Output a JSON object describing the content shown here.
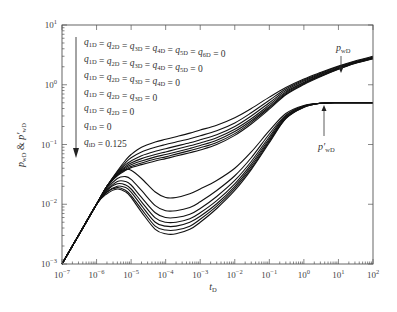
{
  "chart_data": {
    "type": "line",
    "title": "",
    "xlabel": "t_D",
    "ylabel": "p_wD & p'_wD",
    "xscale": "log",
    "yscale": "log",
    "xlim": [
      1e-07,
      100
    ],
    "ylim": [
      0.001,
      10
    ],
    "grid": false,
    "x_ticks": [
      {
        "exp": "-7",
        "value": 1e-07
      },
      {
        "exp": "-6",
        "value": 1e-06
      },
      {
        "exp": "-5",
        "value": 1e-05
      },
      {
        "exp": "-4",
        "value": 0.0001
      },
      {
        "exp": "-3",
        "value": 0.001
      },
      {
        "exp": "-2",
        "value": 0.01
      },
      {
        "exp": "-1",
        "value": 0.1
      },
      {
        "exp": "0",
        "value": 1
      },
      {
        "exp": "1",
        "value": 10
      },
      {
        "exp": "2",
        "value": 100
      }
    ],
    "y_ticks": [
      {
        "exp": "-3",
        "value": 0.001
      },
      {
        "exp": "-2",
        "value": 0.01
      },
      {
        "exp": "-1",
        "value": 0.1
      },
      {
        "exp": "0",
        "value": 1
      },
      {
        "exp": "1",
        "value": 10
      }
    ],
    "legend": {
      "placement": "top-left",
      "arrow": "downward",
      "entries": [
        "q1D = q2D = q3D = q4D = q5D = q6D = 0",
        "q1D = q2D = q3D = q4D = q5D = 0",
        "q1D = q2D = q3D = q4D = 0",
        "q1D = q2D = q3D = 0",
        "q1D = q2D = 0",
        "q1D = 0",
        "qiD = 0.125"
      ]
    },
    "annotations": [
      {
        "text": "p_wD",
        "points_to": {
          "x": 20,
          "y": 2.0
        }
      },
      {
        "text": "p'_wD",
        "points_to": {
          "x": 4,
          "y": 0.48
        }
      }
    ],
    "x": [
      1e-07,
      3e-07,
      1e-06,
      2e-06,
      4e-06,
      7e-06,
      1e-05,
      2e-05,
      5e-05,
      0.0001,
      0.0002,
      0.0005,
      0.001,
      0.003,
      0.01,
      0.03,
      0.1,
      0.3,
      1,
      3,
      10,
      30,
      100
    ],
    "series": [
      {
        "name": "pwD case 1",
        "group": "pressure",
        "values": [
          0.001,
          0.003,
          0.01,
          0.02,
          0.036,
          0.055,
          0.068,
          0.09,
          0.11,
          0.122,
          0.135,
          0.155,
          0.175,
          0.21,
          0.28,
          0.4,
          0.62,
          0.9,
          1.25,
          1.6,
          2.05,
          2.5,
          3.0
        ]
      },
      {
        "name": "pwD case 2",
        "group": "pressure",
        "values": [
          0.001,
          0.003,
          0.01,
          0.02,
          0.035,
          0.05,
          0.06,
          0.075,
          0.09,
          0.1,
          0.11,
          0.125,
          0.14,
          0.17,
          0.23,
          0.34,
          0.55,
          0.85,
          1.2,
          1.55,
          2.0,
          2.45,
          2.9
        ]
      },
      {
        "name": "pwD case 3",
        "group": "pressure",
        "values": [
          0.001,
          0.003,
          0.01,
          0.02,
          0.034,
          0.046,
          0.053,
          0.065,
          0.077,
          0.085,
          0.094,
          0.107,
          0.12,
          0.145,
          0.2,
          0.3,
          0.5,
          0.8,
          1.15,
          1.5,
          1.95,
          2.4,
          2.85
        ]
      },
      {
        "name": "pwD case 4",
        "group": "pressure",
        "values": [
          0.001,
          0.003,
          0.01,
          0.02,
          0.033,
          0.043,
          0.049,
          0.058,
          0.068,
          0.075,
          0.083,
          0.095,
          0.106,
          0.13,
          0.18,
          0.27,
          0.46,
          0.76,
          1.1,
          1.46,
          1.9,
          2.35,
          2.8
        ]
      },
      {
        "name": "pwD case 5",
        "group": "pressure",
        "values": [
          0.001,
          0.003,
          0.01,
          0.02,
          0.032,
          0.041,
          0.046,
          0.053,
          0.062,
          0.068,
          0.075,
          0.086,
          0.096,
          0.118,
          0.165,
          0.25,
          0.43,
          0.73,
          1.07,
          1.42,
          1.87,
          2.32,
          2.77
        ]
      },
      {
        "name": "pwD case 6",
        "group": "pressure",
        "values": [
          0.001,
          0.003,
          0.01,
          0.02,
          0.031,
          0.039,
          0.043,
          0.049,
          0.057,
          0.062,
          0.069,
          0.079,
          0.088,
          0.108,
          0.152,
          0.235,
          0.41,
          0.7,
          1.04,
          1.39,
          1.84,
          2.29,
          2.74
        ]
      },
      {
        "name": "pwD case 7",
        "group": "pressure",
        "values": [
          0.001,
          0.003,
          0.01,
          0.02,
          0.03,
          0.037,
          0.041,
          0.046,
          0.053,
          0.058,
          0.064,
          0.073,
          0.081,
          0.1,
          0.142,
          0.22,
          0.39,
          0.68,
          1.01,
          1.36,
          1.81,
          2.26,
          2.71
        ]
      },
      {
        "name": "p'wD case 1",
        "group": "derivative",
        "values": [
          0.001,
          0.003,
          0.01,
          0.019,
          0.031,
          0.038,
          0.037,
          0.027,
          0.016,
          0.013,
          0.013,
          0.015,
          0.018,
          0.025,
          0.04,
          0.075,
          0.17,
          0.33,
          0.45,
          0.49,
          0.5,
          0.5,
          0.5
        ]
      },
      {
        "name": "p'wD case 2",
        "group": "derivative",
        "values": [
          0.001,
          0.003,
          0.01,
          0.018,
          0.027,
          0.029,
          0.026,
          0.017,
          0.0095,
          0.0078,
          0.0078,
          0.0088,
          0.011,
          0.017,
          0.03,
          0.06,
          0.15,
          0.31,
          0.44,
          0.49,
          0.5,
          0.5,
          0.5
        ]
      },
      {
        "name": "p'wD case 3",
        "group": "derivative",
        "values": [
          0.001,
          0.003,
          0.01,
          0.017,
          0.024,
          0.024,
          0.021,
          0.013,
          0.0072,
          0.006,
          0.006,
          0.0068,
          0.0085,
          0.0135,
          0.025,
          0.052,
          0.135,
          0.3,
          0.44,
          0.49,
          0.5,
          0.5,
          0.5
        ]
      },
      {
        "name": "p'wD case 4",
        "group": "derivative",
        "values": [
          0.001,
          0.003,
          0.01,
          0.017,
          0.022,
          0.021,
          0.018,
          0.011,
          0.0059,
          0.005,
          0.005,
          0.0057,
          0.0072,
          0.0115,
          0.022,
          0.047,
          0.125,
          0.29,
          0.43,
          0.49,
          0.5,
          0.5,
          0.5
        ]
      },
      {
        "name": "p'wD case 5",
        "group": "derivative",
        "values": [
          0.001,
          0.003,
          0.01,
          0.016,
          0.02,
          0.019,
          0.016,
          0.0095,
          0.005,
          0.0043,
          0.0043,
          0.005,
          0.0063,
          0.0102,
          0.02,
          0.043,
          0.118,
          0.28,
          0.43,
          0.49,
          0.5,
          0.5,
          0.5
        ]
      },
      {
        "name": "p'wD case 6",
        "group": "derivative",
        "values": [
          0.001,
          0.003,
          0.01,
          0.016,
          0.019,
          0.017,
          0.014,
          0.0083,
          0.0043,
          0.0037,
          0.0037,
          0.0043,
          0.0056,
          0.0093,
          0.0185,
          0.04,
          0.112,
          0.275,
          0.42,
          0.49,
          0.5,
          0.5,
          0.5
        ]
      },
      {
        "name": "p'wD case 7",
        "group": "derivative",
        "values": [
          0.001,
          0.003,
          0.01,
          0.015,
          0.018,
          0.016,
          0.013,
          0.0074,
          0.0038,
          0.0032,
          0.0032,
          0.0038,
          0.005,
          0.0085,
          0.017,
          0.038,
          0.107,
          0.27,
          0.42,
          0.49,
          0.5,
          0.5,
          0.5
        ]
      }
    ]
  }
}
